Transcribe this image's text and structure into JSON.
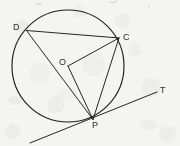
{
  "figure": {
    "type": "circle-geometry-diagram",
    "canvas": {
      "width": 180,
      "height": 146
    },
    "background_color": "#f4f4f3",
    "stroke_color": "#262626",
    "circle": {
      "center_x": 68,
      "center_y": 66,
      "radius": 56
    },
    "points": [
      {
        "id": "D",
        "label": "D",
        "x": 26.5,
        "y": 30.5,
        "label_x": 13,
        "label_y": 23
      },
      {
        "id": "C",
        "label": "C",
        "x": 119,
        "y": 38,
        "label_x": 123,
        "label_y": 33
      },
      {
        "id": "O",
        "label": "O",
        "x": 68,
        "y": 66,
        "label_x": 59,
        "label_y": 58
      },
      {
        "id": "P",
        "label": "P",
        "x": 93,
        "y": 119.5,
        "label_x": 92,
        "label_y": 121
      },
      {
        "id": "T",
        "label": "T",
        "x": 157,
        "y": 92,
        "label_x": 160,
        "label_y": 86
      }
    ],
    "segments": [
      {
        "name": "segment-DC",
        "from": "D",
        "to": "C"
      },
      {
        "name": "segment-DP",
        "from": "D",
        "to": "P"
      },
      {
        "name": "segment-CP",
        "from": "C",
        "to": "P"
      },
      {
        "name": "radius-OC",
        "from": "O",
        "to": "C"
      },
      {
        "name": "radius-OP",
        "from": "O",
        "to": "P"
      },
      {
        "name": "tangent-line",
        "from": "tangent-start",
        "to": "T"
      }
    ],
    "tangent": {
      "start_x": 30,
      "start_y": 143,
      "end_x": 157,
      "end_y": 92
    },
    "labels": {
      "D": "D",
      "C": "C",
      "O": "O",
      "P": "P",
      "T": "T"
    }
  }
}
